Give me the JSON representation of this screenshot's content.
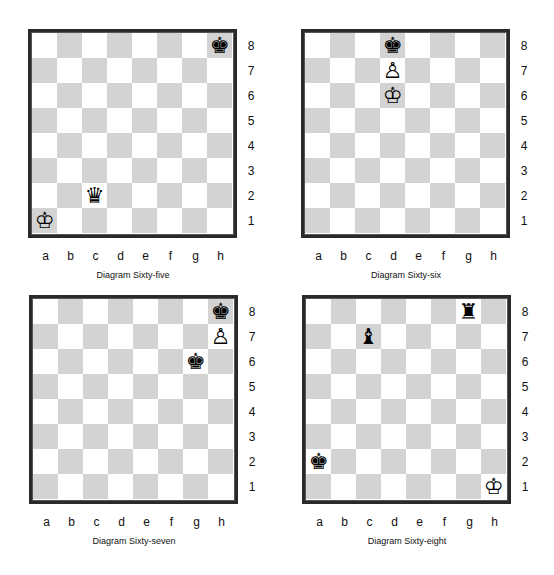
{
  "diagrams": [
    {
      "caption": "Diagram Sixty-five",
      "pieces": [
        {
          "square": "h8",
          "type": "king",
          "color": "black",
          "glyph": "♚"
        },
        {
          "square": "c2",
          "type": "queen",
          "color": "black",
          "glyph": "♛"
        },
        {
          "square": "a1",
          "type": "king",
          "color": "white",
          "glyph": "♔"
        }
      ]
    },
    {
      "caption": "Diagram Sixty-six",
      "pieces": [
        {
          "square": "d8",
          "type": "king",
          "color": "black",
          "glyph": "♚"
        },
        {
          "square": "d7",
          "type": "pawn",
          "color": "white",
          "glyph": "♙"
        },
        {
          "square": "d6",
          "type": "king",
          "color": "white",
          "glyph": "♔"
        }
      ]
    },
    {
      "caption": "Diagram Sixty-seven",
      "pieces": [
        {
          "square": "h8",
          "type": "king",
          "color": "black",
          "glyph": "♚"
        },
        {
          "square": "h7",
          "type": "pawn",
          "color": "white",
          "glyph": "♙"
        },
        {
          "square": "g6",
          "type": "king",
          "color": "black",
          "glyph": "♚"
        }
      ]
    },
    {
      "caption": "Diagram Sixty-eight",
      "pieces": [
        {
          "square": "g8",
          "type": "rook",
          "color": "black",
          "glyph": "♜"
        },
        {
          "square": "c7",
          "type": "bishop",
          "color": "black",
          "glyph": "♝"
        },
        {
          "square": "a2",
          "type": "king",
          "color": "black",
          "glyph": "♚"
        },
        {
          "square": "h1",
          "type": "king",
          "color": "white",
          "glyph": "♔"
        }
      ]
    }
  ],
  "files": [
    "a",
    "b",
    "c",
    "d",
    "e",
    "f",
    "g",
    "h"
  ],
  "ranks": [
    "8",
    "7",
    "6",
    "5",
    "4",
    "3",
    "2",
    "1"
  ],
  "colors": {
    "light_square": "#ffffff",
    "dark_square": "#d3d3d3",
    "border": "#2a2a2a"
  }
}
